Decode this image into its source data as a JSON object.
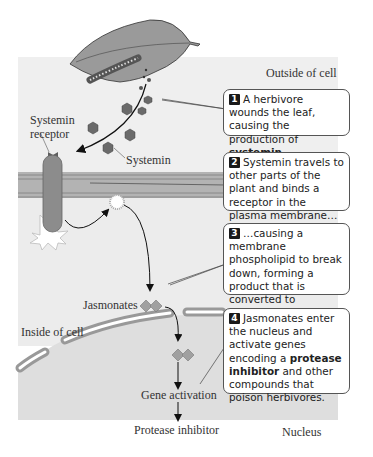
{
  "labels": {
    "outside_cell": "Outside of cell",
    "systemin_receptor_line1": "Systemin",
    "systemin_receptor_line2": "receptor",
    "systemin": "Systemin",
    "jasmonates": "Jasmonates",
    "inside_cell": "Inside of cell",
    "gene_activation": "Gene activation",
    "protease_inhibitor": "Protease inhibitor",
    "nucleus": "Nucleus"
  },
  "steps": [
    {
      "number": "1",
      "text_before": "A herbivore wounds the leaf, causing the production of ",
      "bold": "systemin",
      "text_after": "."
    },
    {
      "number": "2",
      "text_before": "Systemin travels to other parts of the plant and binds a receptor in the plasma membrane…",
      "bold": "",
      "text_after": ""
    },
    {
      "number": "3",
      "text_before": "…causing a membrane phospholipid to break down, forming a product that is converted to ",
      "bold": "jasmonates.",
      "text_after": ""
    },
    {
      "number": "4",
      "text_before": "Jasmonates enter the nucleus and activate genes encoding a ",
      "bold": "protease inhibitor",
      "text_after": " and other compounds that poison herbivores."
    }
  ],
  "colors": {
    "cell_background": "#efefef",
    "nucleus_background": "#dcdcdc",
    "membrane": "#a8a8a8",
    "systemin_hexagon": "#6a6a6a",
    "receptor": "#8c8c8c",
    "jasmonate_diamond": "#a0a0a0"
  }
}
